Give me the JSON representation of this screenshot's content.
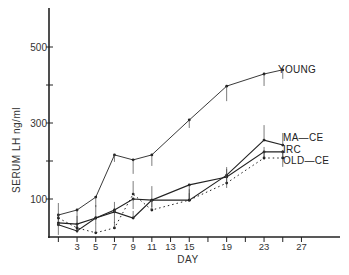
{
  "chart_data": {
    "type": "line",
    "title": "",
    "xlabel": "DAY",
    "ylabel": "SERUM LH ng/ml",
    "x_tick_labels": [
      "3",
      "5",
      "7",
      "9",
      "11",
      "13",
      "15",
      "19",
      "23",
      "27"
    ],
    "x_ticks_days": [
      1,
      3,
      5,
      7,
      9,
      11,
      13,
      15,
      17,
      19,
      21,
      23,
      25,
      27
    ],
    "y_tick_labels": [
      "100",
      "300",
      "500"
    ],
    "y_ticks": [
      100,
      200,
      300,
      400,
      500
    ],
    "xlim": [
      0,
      29
    ],
    "ylim": [
      0,
      580
    ],
    "grid": false,
    "legend_position": "inline labels at line ends (right)",
    "x": [
      1,
      3,
      5,
      7,
      9,
      11,
      15,
      19,
      23,
      25
    ],
    "series": [
      {
        "name": "YOUNG",
        "style": "solid thin",
        "values": [
          58,
          71,
          105,
          216,
          203,
          216,
          308,
          397,
          429,
          440
        ]
      },
      {
        "name": "MA-CE",
        "style": "solid",
        "values": [
          32,
          16,
          50,
          66,
          50,
          97,
          97,
          163,
          255,
          242
        ]
      },
      {
        "name": "IRC",
        "style": "solid",
        "values": [
          37,
          34,
          50,
          71,
          100,
          97,
          137,
          158,
          224,
          224
        ]
      },
      {
        "name": "OLD-CE",
        "style": "dotted",
        "values": [
          50,
          24,
          11,
          24,
          113,
          71,
          97,
          142,
          208,
          208
        ]
      }
    ]
  },
  "labels": {
    "ylabel": "SERUM LH ng/ml",
    "xlabel": "DAY",
    "series": [
      "YOUNG",
      "MA—CE",
      "IRC",
      "OLD—CE"
    ]
  }
}
